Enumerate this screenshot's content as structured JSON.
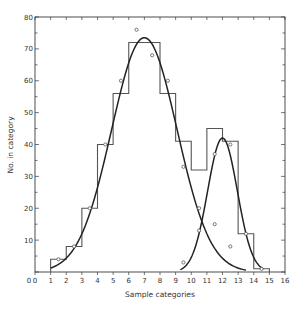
{
  "chart_data": {
    "type": "bar",
    "title": "",
    "xlabel": "Sample categories",
    "ylabel": "No. in category",
    "xlim": [
      0,
      16
    ],
    "ylim": [
      0,
      80
    ],
    "xticks": [
      0,
      1,
      2,
      3,
      4,
      5,
      6,
      7,
      8,
      9,
      10,
      11,
      12,
      13,
      14,
      15,
      16
    ],
    "yticks": [
      0,
      10,
      20,
      30,
      40,
      50,
      60,
      70,
      80
    ],
    "grid": false,
    "histogram": {
      "bin_edges": [
        1,
        2,
        3,
        4,
        5,
        6,
        8,
        9,
        10,
        11,
        12,
        13,
        14,
        15
      ],
      "heights": [
        4,
        8,
        20,
        40,
        56,
        72,
        56,
        41,
        32,
        45,
        41,
        12,
        1
      ]
    },
    "observed_points": [
      {
        "x": 1.5,
        "y": 4
      },
      {
        "x": 2.5,
        "y": 8
      },
      {
        "x": 3.5,
        "y": 20
      },
      {
        "x": 4.5,
        "y": 40
      },
      {
        "x": 5.5,
        "y": 60
      },
      {
        "x": 6.5,
        "y": 76
      },
      {
        "x": 7.5,
        "y": 68
      },
      {
        "x": 8.5,
        "y": 60
      },
      {
        "x": 9.5,
        "y": 33
      },
      {
        "x": 10.5,
        "y": 20
      },
      {
        "x": 11.5,
        "y": 15
      },
      {
        "x": 12.5,
        "y": 8
      },
      {
        "x": 9.5,
        "y": 3
      },
      {
        "x": 10.5,
        "y": 13
      },
      {
        "x": 11.5,
        "y": 37
      },
      {
        "x": 12.5,
        "y": 40
      },
      {
        "x": 13.5,
        "y": 12
      },
      {
        "x": 14.5,
        "y": 1
      }
    ],
    "series": [
      {
        "name": "Fitted curve 1 (large peak)",
        "peak_x": 7,
        "peak_y": 73.5,
        "sd": 2.1,
        "x_range": [
          1,
          13.5
        ]
      },
      {
        "name": "Fitted curve 2 (small peak)",
        "peak_x": 12,
        "peak_y": 42,
        "sd": 0.95,
        "x_range": [
          9.3,
          14.6
        ]
      }
    ]
  }
}
